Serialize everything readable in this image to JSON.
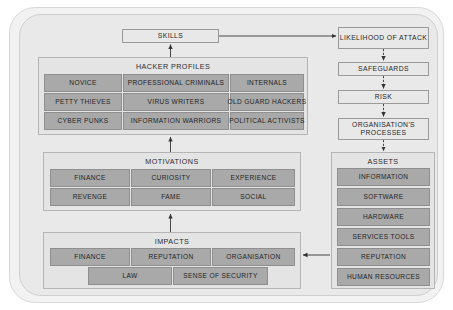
{
  "diagram": {
    "title_present": false,
    "colors": {
      "page_background": "#ffffff",
      "frame_outer": "#f2f2f2",
      "frame_inner": "#e9e9e9",
      "panel_background": "#e4e4e4",
      "cell_fill": "#a9a9a9",
      "node_fill": "#e8e8e8",
      "border": "#8f8f8f",
      "arrow": "#333333",
      "text": "#1f1f1f"
    }
  },
  "skills": {
    "label": "SKILLS"
  },
  "hacker_profiles": {
    "title": "HACKER PROFILES",
    "rows": [
      [
        "NOVICE",
        "PROFESSIONAL CRIMINALS",
        "INTERNALS"
      ],
      [
        "PETTY THIEVES",
        "VIRUS WRITERS",
        "OLD GUARD HACKERS"
      ],
      [
        "CYBER PUNKS",
        "INFORMATION WARRIORS",
        "POLITICAL ACTIVISTS"
      ]
    ]
  },
  "motivations": {
    "title": "MOTIVATIONS",
    "rows": [
      [
        "FINANCE",
        "CURIOSITY",
        "EXPERIENCE"
      ],
      [
        "REVENGE",
        "FAME",
        "SOCIAL"
      ]
    ]
  },
  "impacts": {
    "title": "IMPACTS",
    "row1": [
      "FINANCE",
      "REPUTATION",
      "ORGANISATION"
    ],
    "row2": [
      "LAW",
      "SENSE OF SECURITY"
    ]
  },
  "risk_chain": {
    "nodes": [
      "LIKELIHOOD OF ATTACK",
      "SAFEGUARDS",
      "RISK",
      "ORGANISATION'S PROCESSES"
    ]
  },
  "assets": {
    "title": "ASSETS",
    "items": [
      "INFORMATION",
      "SOFTWARE",
      "HARDWARE",
      "SERVICES TOOLS",
      "REPUTATION",
      "HUMAN RESOURCES"
    ]
  }
}
